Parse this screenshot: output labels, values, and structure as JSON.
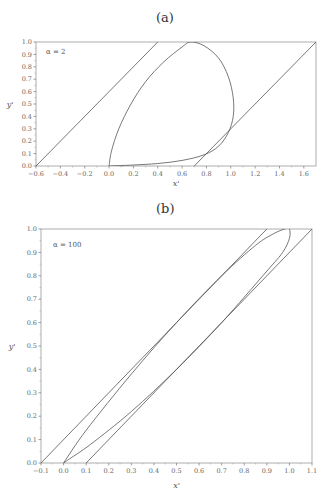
{
  "chart_data": [
    {
      "panel": "(a)",
      "type": "line",
      "title": "(a)",
      "annotation": "α = 2",
      "xlabel": "x'",
      "ylabel": "y'",
      "xlim": [
        -0.6,
        1.7
      ],
      "ylim": [
        0.0,
        1.0
      ],
      "xticks": [
        "-0.6",
        "-0.4",
        "-0.2",
        "0.0",
        "0.2",
        "0.4",
        "0.6",
        "0.8",
        "1.0",
        "1.2",
        "1.4",
        "1.6"
      ],
      "yticks": [
        "0.0",
        "0.1",
        "0.2",
        "0.3",
        "0.4",
        "0.5",
        "0.6",
        "0.7",
        "0.8",
        "0.9",
        "1.0"
      ],
      "grid": false,
      "series": [
        {
          "name": "left boundary line",
          "x": [
            -0.6,
            0.4
          ],
          "y": [
            0.0,
            1.0
          ]
        },
        {
          "name": "right boundary line",
          "x": [
            0.7,
            1.7
          ],
          "y": [
            0.0,
            1.0
          ]
        },
        {
          "name": "closed curve",
          "x": [
            0.0,
            0.02,
            0.08,
            0.18,
            0.3,
            0.45,
            0.6,
            0.67,
            0.78,
            0.9,
            0.98,
            1.02,
            1.02,
            0.98,
            0.9,
            0.78,
            0.6,
            0.4,
            0.2,
            0.05,
            0.0
          ],
          "y": [
            0.0,
            0.12,
            0.3,
            0.5,
            0.68,
            0.84,
            0.96,
            1.0,
            0.97,
            0.87,
            0.72,
            0.55,
            0.4,
            0.27,
            0.16,
            0.09,
            0.045,
            0.02,
            0.008,
            0.002,
            0.0
          ]
        }
      ]
    },
    {
      "panel": "(b)",
      "type": "line",
      "title": "(b)",
      "annotation": "α = 100",
      "xlabel": "x'",
      "ylabel": "y'",
      "xlim": [
        -0.1,
        1.1
      ],
      "ylim": [
        0.0,
        1.0
      ],
      "xticks": [
        "-0.1",
        "0.0",
        "0.1",
        "0.2",
        "0.3",
        "0.4",
        "0.5",
        "0.6",
        "0.7",
        "0.8",
        "0.9",
        "1.0",
        "1.1"
      ],
      "yticks": [
        "0.0",
        "0.1",
        "0.2",
        "0.3",
        "0.4",
        "0.5",
        "0.6",
        "0.7",
        "0.8",
        "0.9",
        "1.0"
      ],
      "grid": false,
      "series": [
        {
          "name": "left boundary line",
          "x": [
            -0.1,
            0.9
          ],
          "y": [
            0.0,
            1.0
          ]
        },
        {
          "name": "right boundary line",
          "x": [
            0.1,
            1.1
          ],
          "y": [
            0.0,
            1.0
          ]
        },
        {
          "name": "closed curve",
          "x": [
            0.0,
            0.1,
            0.3,
            0.5,
            0.7,
            0.85,
            0.93,
            0.98,
            1.0,
            1.0,
            0.97,
            0.9,
            0.7,
            0.5,
            0.3,
            0.12,
            0.03,
            0.0
          ],
          "y": [
            0.0,
            0.14,
            0.38,
            0.6,
            0.8,
            0.93,
            0.98,
            1.0,
            1.0,
            0.96,
            0.9,
            0.82,
            0.6,
            0.4,
            0.22,
            0.08,
            0.02,
            0.0
          ]
        }
      ]
    }
  ]
}
